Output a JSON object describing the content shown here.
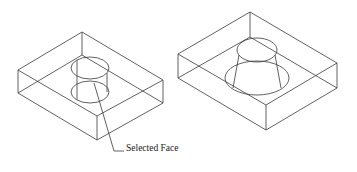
{
  "diagram": {
    "title": "",
    "callout": {
      "label": "Selected Face"
    },
    "figures": [
      {
        "name": "box-with-cylindrical-hole",
        "feature": "cylinder"
      },
      {
        "name": "box-with-tapered-hole",
        "feature": "cone-frustum"
      }
    ],
    "colors": {
      "background": "#ffffff",
      "line": "#3a3a3a",
      "text": "#1a1a1a"
    }
  }
}
